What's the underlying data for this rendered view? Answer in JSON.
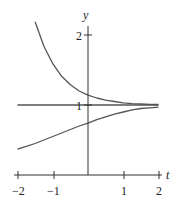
{
  "chart_data": {
    "type": "line",
    "title": "",
    "xlabel": "t",
    "ylabel": "y",
    "xlim": [
      -2,
      2
    ],
    "ylim": [
      0,
      2
    ],
    "x_ticks": [
      "-2",
      "-1",
      "1",
      "2"
    ],
    "y_ticks": [
      "1",
      "2"
    ],
    "grid": false,
    "series": [
      {
        "name": "upper solution",
        "x": [
          -1.5,
          -1.25,
          -1,
          -0.75,
          -0.5,
          -0.25,
          0,
          0.25,
          0.5,
          0.75,
          1,
          1.25,
          1.5,
          1.75,
          2
        ],
        "y": [
          2.19,
          1.84,
          1.59,
          1.41,
          1.29,
          1.2,
          1.14,
          1.1,
          1.07,
          1.05,
          1.03,
          1.02,
          1.015,
          1.01,
          1.007
        ]
      },
      {
        "name": "equilibrium y=1",
        "x": [
          -2,
          2
        ],
        "y": [
          1,
          1
        ]
      },
      {
        "name": "lower solution",
        "x": [
          -2,
          -1.75,
          -1.5,
          -1.25,
          -1,
          -0.75,
          -0.5,
          -0.25,
          0,
          0.25,
          0.5,
          0.75,
          1,
          1.25,
          1.5,
          1.75,
          2
        ],
        "y": [
          0.37,
          0.41,
          0.45,
          0.5,
          0.55,
          0.6,
          0.65,
          0.7,
          0.74,
          0.79,
          0.83,
          0.87,
          0.9,
          0.93,
          0.95,
          0.96,
          0.97
        ]
      }
    ]
  },
  "labels": {
    "x_axis": "t",
    "y_axis": "y",
    "tick_m2": "−2",
    "tick_m1": "−1",
    "tick_1": "1",
    "tick_2": "2",
    "ytick_1": "1",
    "ytick_2": "2"
  },
  "colors": {
    "axis": "#333333",
    "curve": "#555555"
  }
}
